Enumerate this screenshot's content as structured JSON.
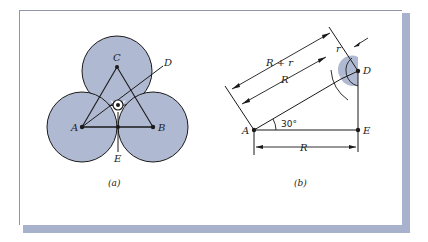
{
  "figure_a": {
    "caption": "(a)",
    "labels": {
      "A": "A",
      "B": "B",
      "C": "C",
      "D": "D",
      "E": "E"
    }
  },
  "figure_b": {
    "caption": "(b)",
    "labels": {
      "A": "A",
      "D": "D",
      "E": "E"
    },
    "dimensions": {
      "outer": "R + r",
      "inner": "R",
      "horizontal": "R",
      "small": "r"
    },
    "angle": "30°"
  },
  "colors": {
    "fill": "#b0b9d2",
    "stroke": "#1a1a1a",
    "shadow": "#a9b2cc"
  }
}
